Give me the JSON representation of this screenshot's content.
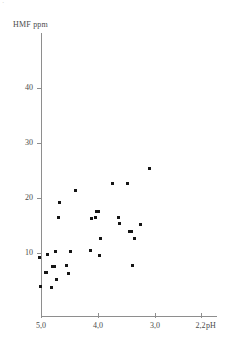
{
  "figure": {
    "corner_mark": "·"
  },
  "axes": {
    "y_axis_label": "HMF ppm",
    "x_axis_unit": "pH",
    "y_ticks": [
      {
        "label": "10",
        "value": 10
      },
      {
        "label": "20",
        "value": 20
      },
      {
        "label": "30",
        "value": 30
      },
      {
        "label": "40",
        "value": 40
      }
    ],
    "x_ticks": [
      {
        "label": "5,0",
        "value": 5.0
      },
      {
        "label": "4,0",
        "value": 4.0
      },
      {
        "label": "3,0",
        "value": 3.0
      },
      {
        "label": "2,2",
        "value": 2.2
      }
    ]
  },
  "chart_data": {
    "type": "scatter",
    "title": "",
    "xlabel": "pH",
    "ylabel": "HMF ppm",
    "xlim": [
      5.2,
      2.0
    ],
    "ylim": [
      0,
      46
    ],
    "x_axis_reversed": true,
    "grid": false,
    "legend": null,
    "x_tick_values": [
      5.0,
      4.0,
      3.0,
      2.2
    ],
    "x_tick_labels": [
      "5,0",
      "4,0",
      "3,0",
      "2,2"
    ],
    "y_tick_values": [
      10,
      20,
      30,
      40
    ],
    "y_tick_labels": [
      "10",
      "20",
      "30",
      "40"
    ],
    "series": [
      {
        "name": "samples",
        "marker": "square",
        "color": "#151515",
        "points": [
          {
            "x": 5.02,
            "y": 9.1
          },
          {
            "x": 5.01,
            "y": 4.0
          },
          {
            "x": 4.92,
            "y": 6.5
          },
          {
            "x": 4.9,
            "y": 6.5
          },
          {
            "x": 4.88,
            "y": 9.8
          },
          {
            "x": 4.82,
            "y": 3.8
          },
          {
            "x": 4.8,
            "y": 7.6
          },
          {
            "x": 4.77,
            "y": 7.6
          },
          {
            "x": 4.75,
            "y": 10.2
          },
          {
            "x": 4.73,
            "y": 5.2
          },
          {
            "x": 4.7,
            "y": 16.4
          },
          {
            "x": 4.68,
            "y": 19.1
          },
          {
            "x": 4.55,
            "y": 7.7
          },
          {
            "x": 4.52,
            "y": 6.3
          },
          {
            "x": 4.48,
            "y": 10.2
          },
          {
            "x": 4.4,
            "y": 21.4
          },
          {
            "x": 4.14,
            "y": 10.4
          },
          {
            "x": 4.12,
            "y": 16.3
          },
          {
            "x": 4.05,
            "y": 16.4
          },
          {
            "x": 4.02,
            "y": 17.6
          },
          {
            "x": 3.99,
            "y": 17.6
          },
          {
            "x": 3.98,
            "y": 9.6
          },
          {
            "x": 3.96,
            "y": 12.7
          },
          {
            "x": 3.75,
            "y": 22.6
          },
          {
            "x": 3.64,
            "y": 16.4
          },
          {
            "x": 3.62,
            "y": 15.3
          },
          {
            "x": 3.48,
            "y": 22.6
          },
          {
            "x": 3.45,
            "y": 13.9
          },
          {
            "x": 3.42,
            "y": 13.9
          },
          {
            "x": 3.4,
            "y": 7.8
          },
          {
            "x": 3.36,
            "y": 12.6
          },
          {
            "x": 3.25,
            "y": 15.2
          },
          {
            "x": 3.1,
            "y": 25.3
          }
        ]
      }
    ]
  }
}
